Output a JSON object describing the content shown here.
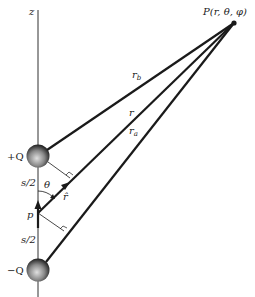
{
  "diagram": {
    "axis_label": "z",
    "point_label": "P(r, θ, φ)",
    "positive_charge_label": "+Q",
    "negative_charge_label": "−Q",
    "dipole_label": "p",
    "half_separation_top": "s/2",
    "half_separation_bottom": "s/2",
    "angle_label": "θ",
    "unit_vector_label": "r̂",
    "distance_labels": {
      "rb": "r",
      "rb_sub": "b",
      "r": "r",
      "ra": "r",
      "ra_sub": "a"
    },
    "colors": {
      "line": "#1a1a1a",
      "charge_dark": "#2b2b2b",
      "charge_light": "#d8d8d8"
    }
  }
}
